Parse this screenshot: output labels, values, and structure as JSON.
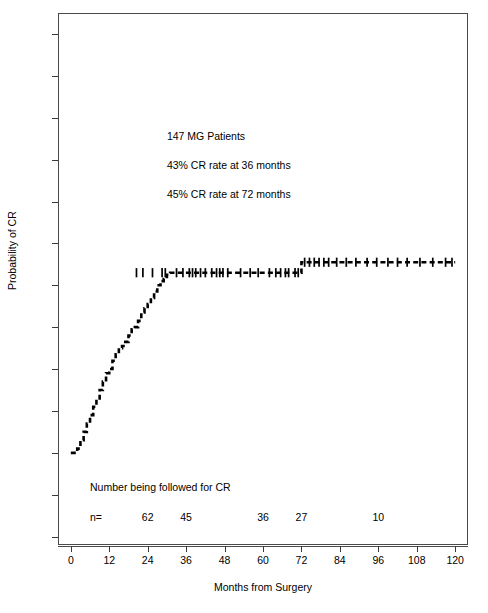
{
  "chart_data": {
    "type": "line",
    "subtype": "kaplan-meier-step",
    "title": "",
    "xlabel": "Months from Surgery",
    "ylabel": "Probability of CR",
    "xlim": [
      -4,
      124
    ],
    "ylim": [
      -0.22,
      1.05
    ],
    "grid": false,
    "legend": null,
    "xticks": [
      0,
      12,
      24,
      36,
      48,
      60,
      72,
      84,
      96,
      108,
      120
    ],
    "xtick_labels": [
      "0",
      "12",
      "24",
      "36",
      "48",
      "60",
      "72",
      "84",
      "96",
      "108",
      "120"
    ],
    "yticks": [
      -0.2,
      -0.1,
      0.0,
      0.1,
      0.2,
      0.3,
      0.4,
      0.5,
      0.6,
      0.7,
      0.8,
      0.9,
      1.0
    ],
    "ytick_labels": [
      "-0.2",
      "-0.1",
      "0.0",
      "0.1",
      "0.2",
      "0.3",
      "0.4",
      "0.5",
      "0.6",
      "0.7",
      "0.8",
      "0.9",
      "1.0"
    ],
    "line_style": "dashed-step",
    "series": [
      {
        "name": "Cumulative probability of CR",
        "x": [
          0,
          1,
          2,
          3,
          4,
          5,
          6,
          7,
          8,
          9,
          10,
          11,
          12,
          13,
          14,
          15,
          16,
          17,
          18,
          19,
          20,
          21,
          22,
          23,
          24,
          25,
          26,
          27,
          28,
          29,
          30,
          31,
          32,
          72,
          120
        ],
        "y": [
          0.0,
          0.0,
          0.01,
          0.03,
          0.05,
          0.07,
          0.09,
          0.11,
          0.13,
          0.15,
          0.17,
          0.19,
          0.2,
          0.22,
          0.235,
          0.25,
          0.255,
          0.265,
          0.28,
          0.295,
          0.3,
          0.315,
          0.335,
          0.345,
          0.355,
          0.37,
          0.385,
          0.4,
          0.41,
          0.415,
          0.425,
          0.43,
          0.43,
          0.455,
          0.455
        ]
      }
    ],
    "censor_marks": {
      "symbol": "+",
      "x": [
        20.5,
        22.5,
        25.5,
        28.5,
        29.5,
        33,
        35,
        37,
        38,
        39,
        40.5,
        42,
        44,
        45.5,
        46.5,
        47.5,
        49,
        53,
        56,
        58.5,
        62,
        64,
        65.5,
        67,
        68,
        70,
        71,
        73,
        74.5,
        76,
        77.5,
        79,
        80.5,
        83,
        86,
        89,
        92.5,
        95.5,
        99,
        102,
        105,
        109,
        113,
        117,
        119
      ],
      "y_plateau_1": 0.43,
      "y_plateau_2": 0.455,
      "plateau_split_x": 72
    },
    "annotations": [
      {
        "text": "147  MG Patients",
        "x": 30,
        "y": 0.755
      },
      {
        "text": "43% CR rate at 36 months",
        "x": 30,
        "y": 0.685
      },
      {
        "text": "45% CR rate at 72 months",
        "x": 30,
        "y": 0.615
      }
    ],
    "risk_table": {
      "caption": "Number being followed for CR",
      "row_label": "n=",
      "times": [
        24,
        36,
        60,
        72,
        96
      ],
      "counts": [
        "62",
        "45",
        "36",
        "27",
        "10"
      ]
    }
  },
  "colors": {
    "curve": "#000000",
    "axis": "#4a4a4a",
    "text": "#000000",
    "background": "#ffffff"
  }
}
